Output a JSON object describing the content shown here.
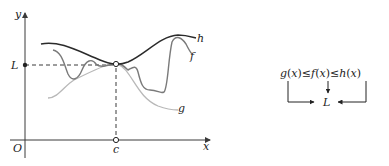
{
  "figure": {
    "axes": {
      "x_label": "x",
      "y_label": "y",
      "origin_label": "O",
      "c_label": "c",
      "L_label": "L"
    },
    "curves": {
      "h": {
        "label": "h",
        "color": "#2b2b2b"
      },
      "f": {
        "label": "f",
        "color": "#7a7a7a"
      },
      "g": {
        "label": "g",
        "color": "#b8b8b8"
      }
    },
    "inequality": {
      "text_parts": [
        "g",
        "(",
        "x",
        ")",
        "≤",
        "f",
        "(",
        "x",
        ")",
        "≤",
        "h",
        "(",
        "x",
        ")"
      ],
      "limit_label": "L"
    }
  },
  "colors": {
    "axis": "#3a3a3a",
    "dashed": "#3a3a3a",
    "h_curve": "#2b2b2b",
    "f_curve": "#7a7a7a",
    "g_curve": "#b8b8b8",
    "text": "#222222"
  }
}
